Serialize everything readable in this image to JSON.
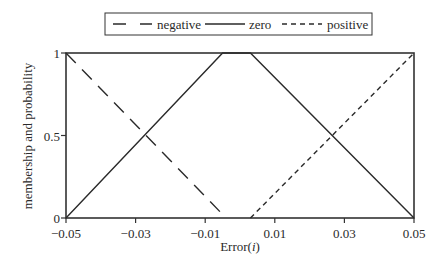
{
  "chart_data": {
    "type": "line",
    "title": "",
    "xlabel": "Error(i)",
    "xlabel_parts": [
      "Error(",
      "i",
      ")"
    ],
    "ylabel": "membership and probability",
    "xlim": [
      -0.05,
      0.05
    ],
    "ylim": [
      0,
      1
    ],
    "xticks": [
      -0.05,
      -0.03,
      -0.01,
      0.01,
      0.03,
      0.05
    ],
    "xtick_labels": [
      "−0.05",
      "−0.03",
      "−0.01",
      "0.01",
      "0.03",
      "0.05"
    ],
    "yticks": [
      0,
      0.5,
      1
    ],
    "ytick_labels": [
      "0",
      "0.5",
      "1"
    ],
    "grid": false,
    "legend_position": "top-center",
    "series": [
      {
        "name": "negative",
        "style": "long-dash",
        "x": [
          -0.05,
          -0.004
        ],
        "y": [
          1,
          0
        ]
      },
      {
        "name": "zero",
        "style": "solid",
        "x": [
          -0.05,
          -0.005,
          0.003,
          0.05
        ],
        "y": [
          0,
          1,
          1,
          0
        ]
      },
      {
        "name": "positive",
        "style": "short-dash",
        "x": [
          0.003,
          0.05
        ],
        "y": [
          0,
          1
        ]
      }
    ]
  }
}
